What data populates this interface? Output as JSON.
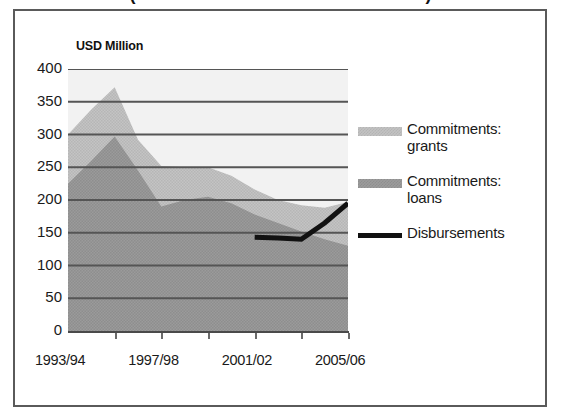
{
  "title": {
    "text": "(Commitments and disbursements)",
    "note": "cut off at top edge of screenshot"
  },
  "axis_title": "USD Million",
  "legend": [
    {
      "label": "Commitments:\ngrants",
      "swatch": "grants",
      "color": "#c2c2c2"
    },
    {
      "label": "Commitments:\nloans",
      "swatch": "loans",
      "color": "#9b9b9b"
    },
    {
      "label": "Disbursements",
      "swatch": "line",
      "color": "#111111"
    }
  ],
  "y_ticks": [
    "400",
    "350",
    "300",
    "250",
    "200",
    "150",
    "100",
    "50",
    "0"
  ],
  "x_ticks": [
    "1993/94",
    "1997/98",
    "2001/02",
    "2005/06"
  ],
  "chart_data": {
    "type": "area",
    "title": "(Commitments and disbursements)",
    "xlabel": "",
    "ylabel": "USD Million",
    "ylim": [
      0,
      400
    ],
    "ytick_step": 50,
    "grid": true,
    "stacked": true,
    "legend_position": "right",
    "x": [
      "1993/94",
      "1994/95",
      "1995/96",
      "1996/97",
      "1997/98",
      "1998/99",
      "1999/00",
      "2000/01",
      "2001/02",
      "2002/03",
      "2003/04",
      "2004/05",
      "2005/06"
    ],
    "x_tick_labels": [
      "1993/94",
      "1997/98",
      "2001/02",
      "2005/06"
    ],
    "series": [
      {
        "name": "Commitments: loans",
        "type": "area",
        "color": "#9b9b9b",
        "values": [
          225,
          260,
          297,
          245,
          190,
          200,
          205,
          195,
          178,
          165,
          152,
          140,
          130
        ]
      },
      {
        "name": "Commitments: grants",
        "type": "area",
        "color": "#c2c2c2",
        "values": [
          75,
          78,
          75,
          47,
          62,
          50,
          45,
          42,
          38,
          35,
          40,
          48,
          67
        ]
      },
      {
        "name": "Disbursements",
        "type": "line",
        "color": "#111111",
        "values": [
          null,
          null,
          null,
          null,
          null,
          null,
          null,
          null,
          143,
          142,
          140,
          165,
          195
        ]
      }
    ],
    "stack_totals": [
      300,
      338,
      372,
      292,
      252,
      250,
      250,
      237,
      216,
      200,
      192,
      188,
      197
    ]
  }
}
